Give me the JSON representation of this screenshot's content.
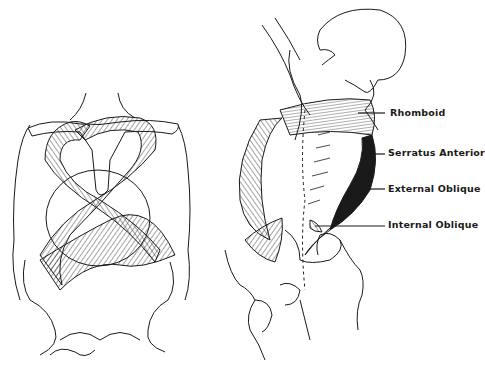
{
  "figure": {
    "left_panel": {
      "description": "Posterior view: crossed spiral muscle bands around torso"
    },
    "right_panel": {
      "description": "Oblique view of torso with labeled muscle chain"
    },
    "labels": [
      {
        "id": "rhomboid",
        "text": "Rhomboid",
        "x": 390,
        "y": 107,
        "line_from": 358,
        "line_y": 113
      },
      {
        "id": "serratus-anterior",
        "text": "Serratus Anterior",
        "x": 388,
        "y": 147,
        "line_from": 367,
        "line_y": 154
      },
      {
        "id": "external-oblique",
        "text": "External Oblique",
        "x": 388,
        "y": 183,
        "line_from": 355,
        "line_y": 189
      },
      {
        "id": "internal-oblique",
        "text": "Internal Oblique",
        "x": 388,
        "y": 219,
        "line_from": 315,
        "line_y": 226
      }
    ],
    "colors": {
      "ink": "#1a1a1a",
      "paper": "#ffffff"
    }
  }
}
